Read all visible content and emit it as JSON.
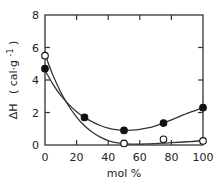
{
  "chart_data": {
    "type": "scatter",
    "title": "",
    "xlabel": "mol %",
    "ylabel": "ΔH  ( cal·g⁻¹ )",
    "ylabel_parts": {
      "symbol": "ΔH",
      "unit": "( cal·g",
      "exp": "-1",
      "close": ")"
    },
    "xlim": [
      0,
      100
    ],
    "ylim": [
      0,
      8
    ],
    "x_ticks": [
      0,
      20,
      40,
      60,
      80,
      100
    ],
    "x_tick_labels": [
      "0",
      "20",
      "40",
      "60",
      "80",
      "100"
    ],
    "y_ticks": [
      0,
      2,
      4,
      6,
      8
    ],
    "y_tick_labels": [
      "0",
      "2",
      "4",
      "6",
      "8"
    ],
    "grid": false,
    "legend": "none",
    "series": [
      {
        "name": "filled",
        "marker": "filled-circle",
        "x": [
          0,
          25,
          50,
          75,
          100
        ],
        "y": [
          4.7,
          1.7,
          0.9,
          1.35,
          2.3
        ],
        "curve_x": [
          0,
          5,
          10,
          15,
          20,
          25,
          30,
          35,
          40,
          45,
          50,
          55,
          60,
          65,
          70,
          75,
          80,
          85,
          90,
          95,
          100
        ],
        "curve_y": [
          4.6,
          3.75,
          3.05,
          2.5,
          2.05,
          1.7,
          1.42,
          1.2,
          1.04,
          0.94,
          0.9,
          0.91,
          0.96,
          1.05,
          1.18,
          1.35,
          1.55,
          1.75,
          1.95,
          2.12,
          2.3
        ]
      },
      {
        "name": "open",
        "marker": "open-circle",
        "x": [
          0,
          50,
          75,
          100
        ],
        "y": [
          5.5,
          0.1,
          0.35,
          0.25
        ],
        "curve_x": [
          0,
          5,
          10,
          15,
          20,
          25,
          30,
          35,
          40,
          45,
          50,
          55,
          60,
          65,
          70,
          75,
          80,
          85,
          90,
          95,
          100
        ],
        "curve_y": [
          5.6,
          4.3,
          3.25,
          2.4,
          1.72,
          1.18,
          0.78,
          0.48,
          0.27,
          0.14,
          0.08,
          0.06,
          0.06,
          0.07,
          0.09,
          0.11,
          0.14,
          0.17,
          0.2,
          0.23,
          0.27
        ]
      }
    ]
  }
}
